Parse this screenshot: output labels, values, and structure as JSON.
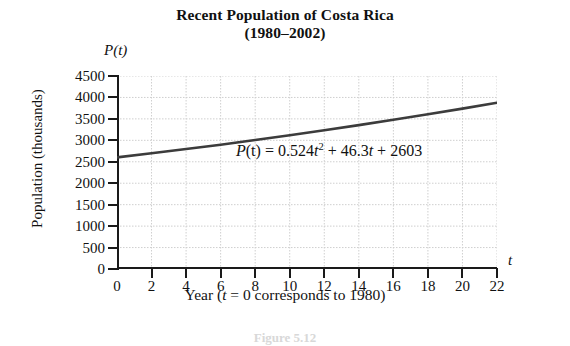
{
  "title": {
    "line1": "Recent Population of Costa Rica",
    "line2": "(1980–2002)"
  },
  "axis_labels": {
    "y_title": "Population (thousands)",
    "x_title_prefix": "Year (",
    "x_title_var": "t",
    "x_title_suffix": " = 0 corresponds to 1980)",
    "y_axis_symbol_fn": "P",
    "y_axis_symbol_arg": "(t)",
    "x_axis_symbol": "t"
  },
  "equation": {
    "lhs_fn": "P",
    "lhs_arg": "(t)",
    "eq": " = ",
    "coef_a": "0.524",
    "var_a": "t",
    "exp_a": "2",
    "plus1": " + ",
    "coef_b": "46.3",
    "var_b": "t",
    "plus2": " + ",
    "const_c": "2603",
    "full": "P(t) = 0.524t^2 + 46.3t + 2603"
  },
  "figure_caption": "Figure 5.12",
  "colors": {
    "axis": "#1a1a1a",
    "curve": "#3c3c3c",
    "grid": "#cfcfcf",
    "background": "#ffffff"
  },
  "chart_data": {
    "type": "line",
    "title": "Recent Population of Costa Rica (1980–2002)",
    "xlabel": "Year (t = 0 corresponds to 1980)",
    "ylabel": "Population (thousands)",
    "xlim": [
      0,
      22
    ],
    "ylim": [
      0,
      4500
    ],
    "xticks": [
      0,
      2,
      4,
      6,
      8,
      10,
      12,
      14,
      16,
      18,
      20,
      22
    ],
    "yticks": [
      0,
      500,
      1000,
      1500,
      2000,
      2500,
      3000,
      3500,
      4000,
      4500
    ],
    "grid": true,
    "legend": null,
    "annotations": [
      {
        "text": "P(t) = 0.524t^2 + 46.3t + 2603",
        "x": 9.5,
        "y": 2450
      }
    ],
    "series": [
      {
        "name": "P(t) = 0.524t^2 + 46.3t + 2603",
        "x": [
          0,
          2,
          4,
          6,
          8,
          10,
          12,
          14,
          16,
          18,
          20,
          22
        ],
        "values": [
          2603,
          2698,
          2797,
          2899,
          3006,
          3118,
          3234,
          3354,
          3478,
          3607,
          3739,
          3876
        ]
      }
    ]
  }
}
